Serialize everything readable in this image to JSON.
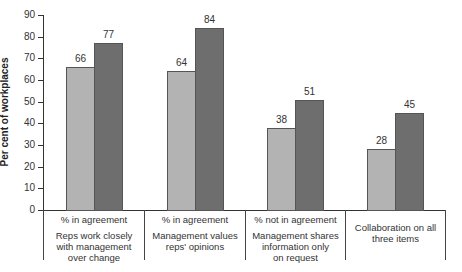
{
  "chart_data": {
    "type": "bar",
    "title": "",
    "xlabel": "",
    "ylabel": "Per cent of workplaces",
    "ylim": [
      0,
      90
    ],
    "yticks": [
      0,
      10,
      20,
      30,
      40,
      50,
      60,
      70,
      80,
      90
    ],
    "grid": false,
    "legend": null,
    "categories": [
      {
        "measure": "% in agreement",
        "label": "Reps work closely with management over change"
      },
      {
        "measure": "% in agreement",
        "label": "Management values reps' opinions"
      },
      {
        "measure": "% not in agreement",
        "label": "Management shares information only on request"
      },
      {
        "measure": "",
        "label": "Collaboration on all three items"
      }
    ],
    "series": [
      {
        "name": "Series 1 (light grey)",
        "color": "#b3b3b3",
        "values": [
          66,
          64,
          38,
          28
        ]
      },
      {
        "name": "Series 2 (dark grey)",
        "color": "#6e6e6e",
        "values": [
          77,
          84,
          51,
          45
        ]
      }
    ]
  },
  "axis": {
    "ylabel": "Per cent of workplaces",
    "ticks": [
      "0",
      "10",
      "20",
      "30",
      "40",
      "50",
      "60",
      "70",
      "80",
      "90"
    ]
  },
  "groups": [
    {
      "measure": "% in agreement",
      "line1": "Reps work closely",
      "line2": "with management",
      "line3": "over change",
      "light": "66",
      "dark": "77"
    },
    {
      "measure": "% in agreement",
      "line1": "Management values",
      "line2": "reps' opinions",
      "line3": "",
      "light": "64",
      "dark": "84"
    },
    {
      "measure": "% not in agreement",
      "line1": "Management shares",
      "line2": "information only",
      "line3": "on request",
      "light": "38",
      "dark": "51"
    },
    {
      "measure": "",
      "line1": "Collaboration on all",
      "line2": "three items",
      "line3": "",
      "light": "28",
      "dark": "45"
    }
  ]
}
